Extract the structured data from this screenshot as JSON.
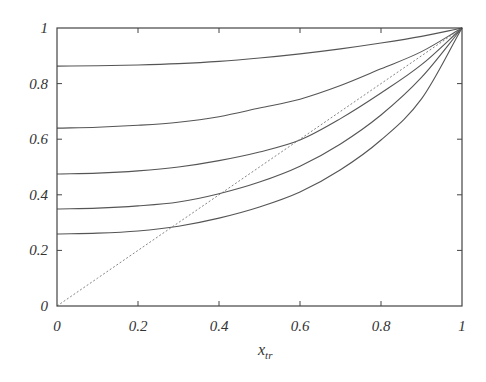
{
  "chart_data": {
    "type": "line",
    "title": "",
    "xlabel": "x_tr",
    "xlabel_main": "x",
    "xlabel_sub": "tr",
    "ylabel": "",
    "xlim": [
      0,
      1
    ],
    "ylim": [
      0,
      1
    ],
    "grid": false,
    "legend": null,
    "x_ticks": [
      "0",
      "0.2",
      "0.4",
      "0.6",
      "0.8",
      "1"
    ],
    "y_ticks": [
      "0",
      "0.2",
      "0.4",
      "0.6",
      "0.8",
      "1"
    ],
    "x": [
      0,
      0.1,
      0.2,
      0.3,
      0.4,
      0.5,
      0.6,
      0.7,
      0.8,
      0.9,
      1.0
    ],
    "series": [
      {
        "name": "curve-1",
        "style": "solid",
        "values": [
          0.863,
          0.864,
          0.867,
          0.872,
          0.88,
          0.892,
          0.907,
          0.925,
          0.946,
          0.97,
          1.0
        ]
      },
      {
        "name": "curve-2",
        "style": "solid",
        "values": [
          0.64,
          0.643,
          0.65,
          0.661,
          0.681,
          0.712,
          0.744,
          0.793,
          0.853,
          0.915,
          1.0
        ]
      },
      {
        "name": "curve-3",
        "style": "solid",
        "values": [
          0.475,
          0.478,
          0.486,
          0.5,
          0.523,
          0.554,
          0.597,
          0.674,
          0.766,
          0.868,
          1.0
        ]
      },
      {
        "name": "curve-4",
        "style": "solid",
        "values": [
          0.349,
          0.352,
          0.36,
          0.374,
          0.404,
          0.446,
          0.503,
          0.583,
          0.687,
          0.822,
          1.0
        ]
      },
      {
        "name": "curve-5",
        "style": "solid",
        "values": [
          0.259,
          0.262,
          0.27,
          0.287,
          0.316,
          0.356,
          0.41,
          0.49,
          0.597,
          0.745,
          1.0
        ]
      },
      {
        "name": "diagonal",
        "style": "dashed",
        "values": [
          0,
          0.1,
          0.2,
          0.3,
          0.4,
          0.5,
          0.6,
          0.7,
          0.8,
          0.9,
          1.0
        ]
      }
    ],
    "colors": {
      "line": "#555555",
      "axis": "#444444",
      "text": "#333333"
    }
  }
}
